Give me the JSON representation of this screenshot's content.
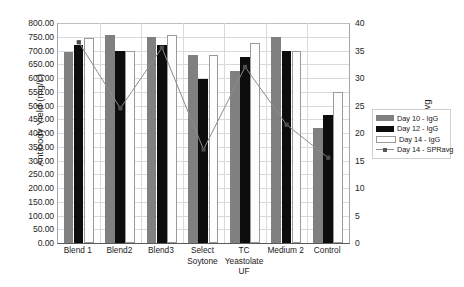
{
  "chart_data": {
    "type": "bar",
    "title": "",
    "xlabel": "",
    "ylabel": "Antibody Yield (mg/L)",
    "y2label": "SPRavg",
    "ylim": [
      0,
      800
    ],
    "ytick_step": 50,
    "y2lim": [
      0,
      40
    ],
    "y2tick_step": 5,
    "grid": true,
    "legend_position": "right",
    "categories": [
      "Blend 1",
      "Blend2",
      "Blend3",
      "Select Soytone",
      "TC Yeastolate UF",
      "Medium 2",
      "Control"
    ],
    "category_lines": [
      [
        "Blend 1"
      ],
      [
        "Blend2"
      ],
      [
        "Blend3"
      ],
      [
        "Select",
        "Soytone"
      ],
      [
        "TC",
        "Yeastolate",
        "UF"
      ],
      [
        "Medium 2"
      ],
      [
        "Control"
      ]
    ],
    "series": [
      {
        "name": "Day 10 - IgG",
        "type": "bar",
        "axis": "left",
        "color": "#808080",
        "values": [
          695,
          755,
          748,
          685,
          625,
          748,
          420
        ]
      },
      {
        "name": "Day 12 - IgG",
        "type": "bar",
        "axis": "left",
        "color": "#0d0d0d",
        "values": [
          720,
          697,
          720,
          597,
          678,
          697,
          467
        ]
      },
      {
        "name": "Day 14 - IgG",
        "type": "bar",
        "axis": "left",
        "color": "#ffffff",
        "values": [
          745,
          697,
          755,
          685,
          728,
          697,
          550
        ]
      },
      {
        "name": "Day 14 - SPRavg",
        "type": "line",
        "axis": "right",
        "color": "#8c8c8c",
        "values": [
          36.5,
          24.5,
          35.5,
          17.0,
          32.0,
          21.5,
          15.5
        ]
      }
    ],
    "ytick_labels_left": [
      "800.00",
      "750.00",
      "700.00",
      "650.00",
      "600.00",
      "550.00",
      "500.00",
      "450.00",
      "400.00",
      "350.00",
      "300.00",
      "250.00",
      "200.00",
      "150.00",
      "100.00",
      "50.00",
      "0.00"
    ],
    "ytick_values_left": [
      800,
      750,
      700,
      650,
      600,
      550,
      500,
      450,
      400,
      350,
      300,
      250,
      200,
      150,
      100,
      50,
      0
    ],
    "ytick_labels_right": [
      "40",
      "35",
      "30",
      "25",
      "20",
      "15",
      "10",
      "5",
      "0"
    ],
    "ytick_values_right": [
      40,
      35,
      30,
      25,
      20,
      15,
      10,
      5,
      0
    ]
  },
  "legend": {
    "items": [
      {
        "label": "Day 10 - IgG",
        "swatch": "swatch-gray"
      },
      {
        "label": "Day 12 - IgG",
        "swatch": "swatch-black"
      },
      {
        "label": "Day 14 - IgG",
        "swatch": "swatch-white"
      },
      {
        "label": "Day 14 - SPRavg",
        "swatch": "swatch-line-marker"
      }
    ]
  }
}
